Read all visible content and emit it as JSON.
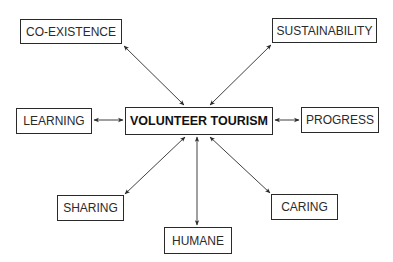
{
  "diagram": {
    "type": "hub-and-spoke",
    "center": {
      "id": "volunteer-tourism",
      "label": "VOLUNTEER TOURISM",
      "box": {
        "x": 125,
        "y": 107,
        "w": 148,
        "h": 28
      }
    },
    "nodes": [
      {
        "id": "co-existence",
        "label": "CO-EXISTENCE",
        "box": {
          "x": 20,
          "y": 19,
          "w": 102,
          "h": 25
        }
      },
      {
        "id": "sustainability",
        "label": "SUSTAINABILITY",
        "box": {
          "x": 272,
          "y": 18,
          "w": 105,
          "h": 25
        }
      },
      {
        "id": "learning",
        "label": "LEARNING",
        "box": {
          "x": 16,
          "y": 108,
          "w": 76,
          "h": 26
        }
      },
      {
        "id": "progress",
        "label": "PROGRESS",
        "box": {
          "x": 301,
          "y": 107,
          "w": 78,
          "h": 26
        }
      },
      {
        "id": "sharing",
        "label": "SHARING",
        "box": {
          "x": 57,
          "y": 195,
          "w": 67,
          "h": 26
        }
      },
      {
        "id": "humane",
        "label": "HUMANE",
        "box": {
          "x": 164,
          "y": 227,
          "w": 68,
          "h": 27
        }
      },
      {
        "id": "caring",
        "label": "CARING",
        "box": {
          "x": 271,
          "y": 194,
          "w": 67,
          "h": 26
        }
      }
    ],
    "edges": [
      {
        "from": "co-existence",
        "to": "volunteer-tourism",
        "direction": "bidirectional",
        "x1": 124,
        "y1": 46,
        "x2": 184,
        "y2": 105
      },
      {
        "from": "sustainability",
        "to": "volunteer-tourism",
        "direction": "bidirectional",
        "x1": 271,
        "y1": 45,
        "x2": 210,
        "y2": 105
      },
      {
        "from": "learning",
        "to": "volunteer-tourism",
        "direction": "bidirectional",
        "x1": 94,
        "y1": 120,
        "x2": 123,
        "y2": 120
      },
      {
        "from": "progress",
        "to": "volunteer-tourism",
        "direction": "bidirectional",
        "x1": 299,
        "y1": 120,
        "x2": 275,
        "y2": 120
      },
      {
        "from": "sharing",
        "to": "volunteer-tourism",
        "direction": "bidirectional",
        "x1": 125,
        "y1": 194,
        "x2": 185,
        "y2": 137
      },
      {
        "from": "humane",
        "to": "volunteer-tourism",
        "direction": "bidirectional",
        "x1": 197,
        "y1": 225,
        "x2": 197,
        "y2": 137
      },
      {
        "from": "caring",
        "to": "volunteer-tourism",
        "direction": "bidirectional",
        "x1": 270,
        "y1": 193,
        "x2": 210,
        "y2": 137
      }
    ],
    "colors": {
      "stroke": "#2a2a2a",
      "background": "#ffffff",
      "text": "#1a1a1a"
    }
  }
}
